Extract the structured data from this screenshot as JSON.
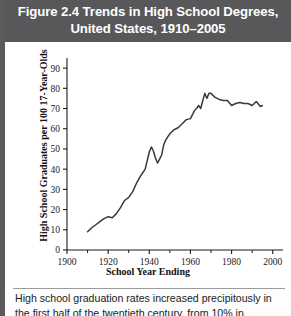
{
  "figure": {
    "title": "Figure 2.4  Trends in High School Degrees, United States, 1910–2005",
    "title_line1": "Figure 2.4  Trends in High School Degrees,",
    "title_line2": "United States, 1910–2005",
    "caption_line1": "High school graduation rates increased precipitously",
    "caption_line2": "in the first half of the twentieth century, from 10% in",
    "banner_color": "#58585a",
    "line_color": "#3a3a3a"
  },
  "chart_data": {
    "type": "line",
    "title": "Trends in High School Degrees, United States, 1910–2005",
    "xlabel": "School Year Ending",
    "ylabel": "High School Graduates per 100 17-Year-Olds",
    "xlim": [
      1900,
      2005
    ],
    "ylim": [
      0,
      95
    ],
    "xticks": [
      1900,
      1920,
      1940,
      1960,
      1980,
      2000
    ],
    "xtick_labels": [
      "1900",
      "1920",
      "1940",
      "1960",
      "1980",
      "2000"
    ],
    "xminor_ticks": [
      1910,
      1930,
      1950,
      1970,
      1990
    ],
    "yticks": [
      0,
      10,
      20,
      30,
      40,
      50,
      60,
      70,
      80,
      90
    ],
    "ytick_labels": [
      "0",
      "10",
      "20",
      "30",
      "40",
      "50",
      "60",
      "70",
      "80",
      "90"
    ],
    "grid": false,
    "legend": false,
    "series": [
      {
        "name": "High school graduates per 100 17-year-olds",
        "x": [
          1910,
          1912,
          1914,
          1916,
          1918,
          1920,
          1922,
          1924,
          1926,
          1928,
          1930,
          1932,
          1934,
          1936,
          1938,
          1940,
          1941,
          1942,
          1943,
          1944,
          1945,
          1946,
          1947,
          1948,
          1950,
          1952,
          1954,
          1956,
          1958,
          1960,
          1962,
          1963,
          1964,
          1965,
          1966,
          1967,
          1968,
          1969,
          1970,
          1972,
          1974,
          1976,
          1978,
          1980,
          1982,
          1984,
          1986,
          1988,
          1990,
          1992,
          1994,
          1995
        ],
        "y": [
          9,
          11,
          12.5,
          14,
          15.5,
          16.5,
          16,
          18,
          21,
          24.5,
          26,
          29,
          33.5,
          37,
          40,
          48.5,
          51,
          49,
          45.5,
          43,
          45,
          47,
          52,
          54.5,
          57.5,
          59.5,
          60.5,
          62.5,
          64.5,
          65,
          69,
          70,
          71.5,
          70,
          74,
          77.5,
          75,
          77.5,
          77.5,
          75.5,
          74.5,
          74,
          74,
          71.5,
          72.5,
          73,
          72.5,
          72.5,
          71.5,
          73.5,
          71,
          71.5
        ]
      }
    ],
    "annotations": [
      {
        "text": "World War II dip",
        "x": 1944,
        "y": 43,
        "visible": false
      }
    ]
  }
}
